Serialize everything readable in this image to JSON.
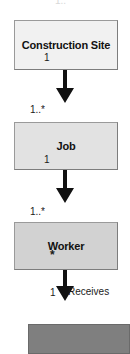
{
  "diagram": {
    "type": "uml-class-association-chain",
    "title": "",
    "background_color": "#ffffff",
    "nodes": [
      {
        "id": "construction-site",
        "label": "Construction Site",
        "fill": "#f1f1f1",
        "border": "#9a9a9a"
      },
      {
        "id": "job",
        "label": "Job",
        "fill": "#e2e2e2",
        "border": "#9a9a9a"
      },
      {
        "id": "worker",
        "label": "Worker",
        "fill": "#d2d2d2",
        "border": "#9a9a9a"
      },
      {
        "id": "partial-bottom",
        "label": "",
        "fill": "#7f7f7f",
        "border": "#6a6a6a"
      }
    ],
    "edges": [
      {
        "id": "construction-site-to-job",
        "from": "construction-site",
        "to": "job",
        "source_multiplicity": "1",
        "target_multiplicity": "1..*",
        "label": "",
        "arrow": "solid-filled-down"
      },
      {
        "id": "job-to-worker",
        "from": "job",
        "to": "worker",
        "source_multiplicity": "1",
        "target_multiplicity": "1..*",
        "label": "",
        "arrow": "solid-filled-down"
      },
      {
        "id": "worker-to-next",
        "from": "worker",
        "to": "partial-bottom",
        "source_multiplicity": "*",
        "target_multiplicity": "1",
        "label": "Receives",
        "arrow": "solid-filled-down"
      }
    ],
    "labels": {
      "top_clipped": "1..*",
      "cs_source_mult": "1",
      "job_target_mult": "1..*",
      "job_source_mult": "1",
      "worker_target_mult": "1..*",
      "worker_source_mult": "*",
      "receives_mult": "1",
      "receives_role": "Receives"
    },
    "icons": {
      "arrow": "arrow-down-icon"
    }
  }
}
